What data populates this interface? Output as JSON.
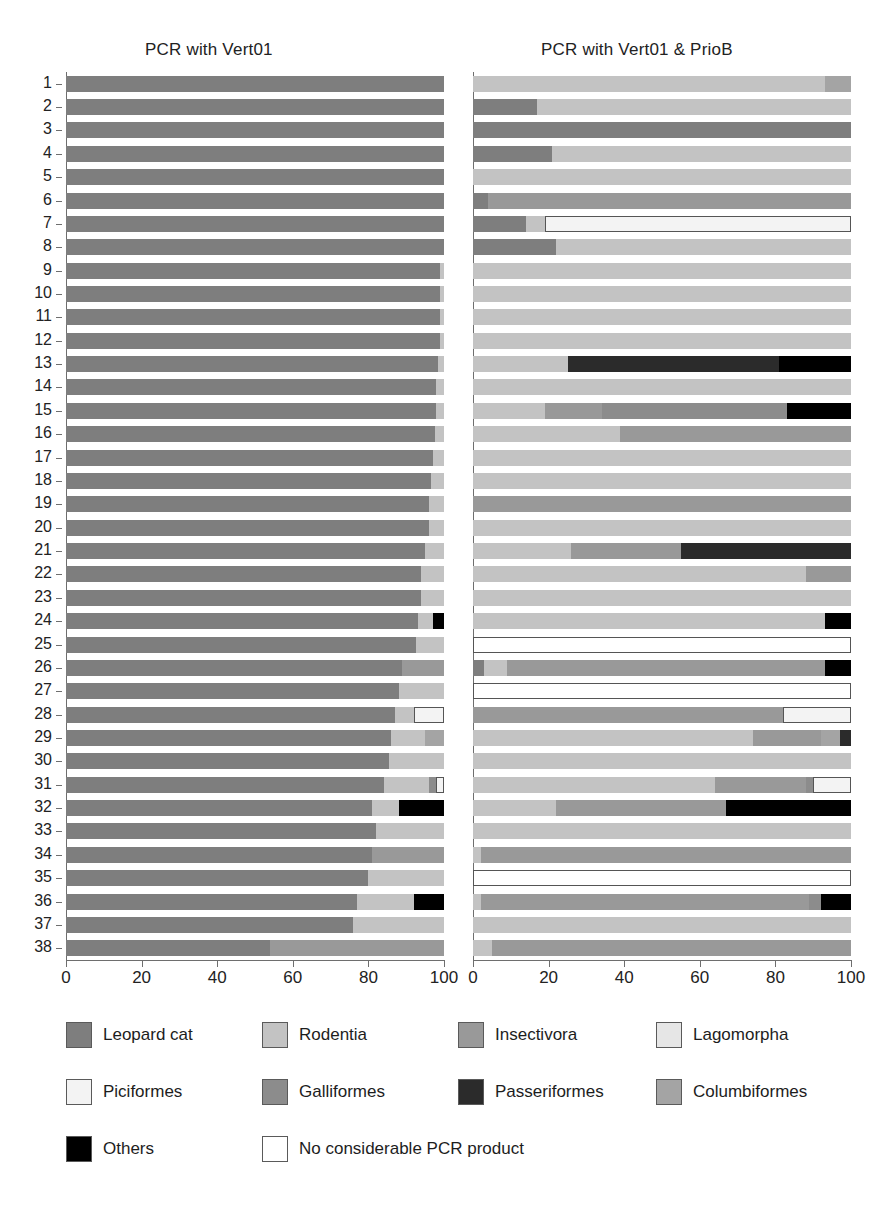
{
  "panels": {
    "left": {
      "title": "PCR with Vert01"
    },
    "right": {
      "title": "PCR with Vert01 & PrioB"
    }
  },
  "axis": {
    "ticks": [
      0,
      20,
      40,
      60,
      80,
      100
    ],
    "tick_labels": [
      "0",
      "20",
      "40",
      "60",
      "80",
      "100"
    ],
    "xlim": [
      0,
      100
    ]
  },
  "sample_labels": [
    "1",
    "2",
    "3",
    "4",
    "5",
    "6",
    "7",
    "8",
    "9",
    "10",
    "11",
    "12",
    "13",
    "14",
    "15",
    "16",
    "17",
    "18",
    "19",
    "20",
    "21",
    "22",
    "23",
    "24",
    "25",
    "26",
    "27",
    "28",
    "29",
    "30",
    "31",
    "32",
    "33",
    "34",
    "35",
    "36",
    "37",
    "38"
  ],
  "legend": {
    "items": [
      {
        "label": "Leopard cat",
        "key": "leopard_cat",
        "color": "#7e7e7e"
      },
      {
        "label": "Rodentia",
        "key": "rodentia",
        "color": "#c3c3c3"
      },
      {
        "label": "Insectivora",
        "key": "insectivora",
        "color": "#999999"
      },
      {
        "label": "Lagomorpha",
        "key": "lagomorpha",
        "color": "#e6e6e6"
      },
      {
        "label": "Piciformes",
        "key": "piciformes",
        "color": "#f3f3f3"
      },
      {
        "label": "Galliformes",
        "key": "galliformes",
        "color": "#8c8c8c"
      },
      {
        "label": "Passeriformes",
        "key": "passeriformes",
        "color": "#2b2b2b"
      },
      {
        "label": "Columbiformes",
        "key": "columbiformes",
        "color": "#a4a4a4"
      },
      {
        "label": "Others",
        "key": "others",
        "color": "#000000"
      },
      {
        "label": "No considerable PCR product",
        "key": "none",
        "color": "#ffffff"
      }
    ]
  },
  "chart_data": {
    "type": "bar",
    "orientation": "horizontal",
    "stacked": true,
    "title": "",
    "xlabel": "",
    "ylabel": "",
    "xlim": [
      0,
      100
    ],
    "grid": false,
    "legend_position": "bottom",
    "categories": [
      "1",
      "2",
      "3",
      "4",
      "5",
      "6",
      "7",
      "8",
      "9",
      "10",
      "11",
      "12",
      "13",
      "14",
      "15",
      "16",
      "17",
      "18",
      "19",
      "20",
      "21",
      "22",
      "23",
      "24",
      "25",
      "26",
      "27",
      "28",
      "29",
      "30",
      "31",
      "32",
      "33",
      "34",
      "35",
      "36",
      "37",
      "38"
    ],
    "series_keys": [
      "leopard_cat",
      "rodentia",
      "insectivora",
      "lagomorpha",
      "piciformes",
      "galliformes",
      "passeriformes",
      "columbiformes",
      "others",
      "none"
    ],
    "panels": [
      {
        "name": "PCR with Vert01",
        "rows": [
          [
            [
              "leopard_cat",
              100
            ]
          ],
          [
            [
              "leopard_cat",
              100
            ]
          ],
          [
            [
              "leopard_cat",
              100
            ]
          ],
          [
            [
              "leopard_cat",
              100
            ]
          ],
          [
            [
              "leopard_cat",
              100
            ]
          ],
          [
            [
              "leopard_cat",
              100
            ]
          ],
          [
            [
              "leopard_cat",
              100
            ]
          ],
          [
            [
              "leopard_cat",
              100
            ]
          ],
          [
            [
              "leopard_cat",
              99
            ],
            [
              "rodentia",
              1
            ]
          ],
          [
            [
              "leopard_cat",
              99
            ],
            [
              "rodentia",
              1
            ]
          ],
          [
            [
              "leopard_cat",
              99
            ],
            [
              "rodentia",
              1
            ]
          ],
          [
            [
              "leopard_cat",
              99
            ],
            [
              "rodentia",
              1
            ]
          ],
          [
            [
              "leopard_cat",
              98.5
            ],
            [
              "rodentia",
              1.5
            ]
          ],
          [
            [
              "leopard_cat",
              98
            ],
            [
              "rodentia",
              2
            ]
          ],
          [
            [
              "leopard_cat",
              98
            ],
            [
              "rodentia",
              2
            ]
          ],
          [
            [
              "leopard_cat",
              97.5
            ],
            [
              "rodentia",
              2.5
            ]
          ],
          [
            [
              "leopard_cat",
              97
            ],
            [
              "rodentia",
              3
            ]
          ],
          [
            [
              "leopard_cat",
              96.5
            ],
            [
              "rodentia",
              3.5
            ]
          ],
          [
            [
              "leopard_cat",
              96
            ],
            [
              "rodentia",
              4
            ]
          ],
          [
            [
              "leopard_cat",
              96
            ],
            [
              "rodentia",
              4
            ]
          ],
          [
            [
              "leopard_cat",
              95
            ],
            [
              "rodentia",
              5
            ]
          ],
          [
            [
              "leopard_cat",
              94
            ],
            [
              "rodentia",
              6
            ]
          ],
          [
            [
              "leopard_cat",
              94
            ],
            [
              "rodentia",
              6
            ]
          ],
          [
            [
              "leopard_cat",
              93
            ],
            [
              "rodentia",
              4
            ],
            [
              "others",
              3
            ]
          ],
          [
            [
              "leopard_cat",
              92.5
            ],
            [
              "rodentia",
              7.5
            ]
          ],
          [
            [
              "leopard_cat",
              89
            ],
            [
              "insectivora",
              11
            ]
          ],
          [
            [
              "leopard_cat",
              88
            ],
            [
              "rodentia",
              12
            ]
          ],
          [
            [
              "leopard_cat",
              87
            ],
            [
              "rodentia",
              5
            ],
            [
              "piciformes",
              8
            ]
          ],
          [
            [
              "leopard_cat",
              86
            ],
            [
              "rodentia",
              9
            ],
            [
              "columbiformes",
              5
            ]
          ],
          [
            [
              "leopard_cat",
              85.5
            ],
            [
              "rodentia",
              14.5
            ]
          ],
          [
            [
              "leopard_cat",
              84
            ],
            [
              "rodentia",
              12
            ],
            [
              "galliformes",
              2
            ],
            [
              "piciformes",
              2
            ]
          ],
          [
            [
              "leopard_cat",
              81
            ],
            [
              "rodentia",
              7
            ],
            [
              "others",
              12
            ]
          ],
          [
            [
              "leopard_cat",
              82
            ],
            [
              "rodentia",
              18
            ]
          ],
          [
            [
              "leopard_cat",
              81
            ],
            [
              "insectivora",
              19
            ]
          ],
          [
            [
              "leopard_cat",
              80
            ],
            [
              "rodentia",
              20
            ]
          ],
          [
            [
              "leopard_cat",
              77
            ],
            [
              "rodentia",
              15
            ],
            [
              "others",
              8
            ]
          ],
          [
            [
              "leopard_cat",
              76
            ],
            [
              "rodentia",
              24
            ]
          ],
          [
            [
              "leopard_cat",
              54
            ],
            [
              "insectivora",
              46
            ]
          ]
        ]
      },
      {
        "name": "PCR with Vert01 & PrioB",
        "rows": [
          [
            [
              "rodentia",
              93
            ],
            [
              "columbiformes",
              7
            ]
          ],
          [
            [
              "leopard_cat",
              17
            ],
            [
              "rodentia",
              83
            ]
          ],
          [
            [
              "leopard_cat",
              100
            ]
          ],
          [
            [
              "leopard_cat",
              21
            ],
            [
              "rodentia",
              79
            ]
          ],
          [
            [
              "rodentia",
              100
            ]
          ],
          [
            [
              "leopard_cat",
              4
            ],
            [
              "insectivora",
              96
            ]
          ],
          [
            [
              "leopard_cat",
              14
            ],
            [
              "rodentia",
              5
            ],
            [
              "piciformes",
              81
            ]
          ],
          [
            [
              "leopard_cat",
              22
            ],
            [
              "rodentia",
              78
            ]
          ],
          [
            [
              "rodentia",
              100
            ]
          ],
          [
            [
              "rodentia",
              100
            ]
          ],
          [
            [
              "rodentia",
              100
            ]
          ],
          [
            [
              "rodentia",
              100
            ]
          ],
          [
            [
              "rodentia",
              25
            ],
            [
              "passeriformes",
              56
            ],
            [
              "others",
              19
            ]
          ],
          [
            [
              "rodentia",
              100
            ]
          ],
          [
            [
              "rodentia",
              19
            ],
            [
              "insectivora",
              15
            ],
            [
              "galliformes",
              49
            ],
            [
              "others",
              17
            ]
          ],
          [
            [
              "rodentia",
              39
            ],
            [
              "insectivora",
              61
            ]
          ],
          [
            [
              "rodentia",
              100
            ]
          ],
          [
            [
              "rodentia",
              100
            ]
          ],
          [
            [
              "insectivora",
              100
            ]
          ],
          [
            [
              "rodentia",
              100
            ]
          ],
          [
            [
              "rodentia",
              26
            ],
            [
              "insectivora",
              29
            ],
            [
              "passeriformes",
              45
            ]
          ],
          [
            [
              "rodentia",
              88
            ],
            [
              "insectivora",
              12
            ]
          ],
          [
            [
              "rodentia",
              100
            ]
          ],
          [
            [
              "rodentia",
              93
            ],
            [
              "others",
              7
            ]
          ],
          [
            [
              "none",
              100
            ]
          ],
          [
            [
              "leopard_cat",
              3
            ],
            [
              "rodentia",
              6
            ],
            [
              "insectivora",
              84
            ],
            [
              "others",
              7
            ]
          ],
          [
            [
              "none",
              100
            ]
          ],
          [
            [
              "insectivora",
              82
            ],
            [
              "piciformes",
              18
            ]
          ],
          [
            [
              "rodentia",
              74
            ],
            [
              "insectivora",
              18
            ],
            [
              "columbiformes",
              5
            ],
            [
              "passeriformes",
              3
            ]
          ],
          [
            [
              "rodentia",
              100
            ]
          ],
          [
            [
              "rodentia",
              64
            ],
            [
              "insectivora",
              24
            ],
            [
              "galliformes",
              2
            ],
            [
              "piciformes",
              10
            ]
          ],
          [
            [
              "rodentia",
              22
            ],
            [
              "insectivora",
              45
            ],
            [
              "others",
              33
            ]
          ],
          [
            [
              "rodentia",
              100
            ]
          ],
          [
            [
              "rodentia",
              2
            ],
            [
              "insectivora",
              98
            ]
          ],
          [
            [
              "none",
              100
            ]
          ],
          [
            [
              "rodentia",
              2
            ],
            [
              "insectivora",
              87
            ],
            [
              "galliformes",
              3
            ],
            [
              "others",
              8
            ]
          ],
          [
            [
              "rodentia",
              100
            ]
          ],
          [
            [
              "rodentia",
              5
            ],
            [
              "insectivora",
              95
            ]
          ]
        ]
      }
    ]
  }
}
